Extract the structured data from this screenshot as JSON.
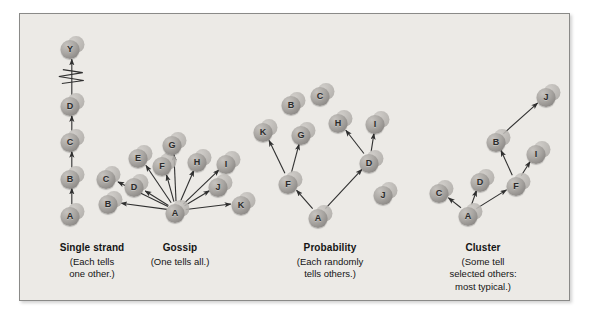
{
  "figure": {
    "background": "#ffffff",
    "panel_background": "#eceae6",
    "border_color": "#8a8a88",
    "node_color": "#a9a6a2",
    "arrow_color": "#2f2f2f",
    "text_color": "#141414"
  },
  "panels": [
    {
      "id": "single-strand",
      "caption_title": "Single strand",
      "caption_lines": [
        "(Each tells",
        "one other.)"
      ],
      "caption_x": 92,
      "caption_y": 242,
      "nodes": [
        {
          "label": "Y",
          "x": 72,
          "y": 48
        },
        {
          "label": "D",
          "x": 72,
          "y": 105
        },
        {
          "label": "C",
          "x": 72,
          "y": 141
        },
        {
          "label": "B",
          "x": 72,
          "y": 178
        },
        {
          "label": "A",
          "x": 72,
          "y": 215
        }
      ],
      "edges": [
        {
          "from": "A",
          "to": "B"
        },
        {
          "from": "B",
          "to": "C"
        },
        {
          "from": "C",
          "to": "D"
        },
        {
          "from": "D",
          "to": "Y"
        }
      ],
      "break_symbol": {
        "x": 72,
        "y": 76,
        "label": "break-zigzag"
      }
    },
    {
      "id": "gossip",
      "caption_title": "Gossip",
      "caption_lines": [
        "(One tells all.)"
      ],
      "caption_x": 180,
      "caption_y": 242,
      "nodes": [
        {
          "label": "A",
          "x": 177,
          "y": 212
        },
        {
          "label": "B",
          "x": 110,
          "y": 203
        },
        {
          "label": "C",
          "x": 108,
          "y": 178
        },
        {
          "label": "D",
          "x": 136,
          "y": 186
        },
        {
          "label": "E",
          "x": 140,
          "y": 157
        },
        {
          "label": "F",
          "x": 164,
          "y": 165
        },
        {
          "label": "G",
          "x": 174,
          "y": 144
        },
        {
          "label": "H",
          "x": 199,
          "y": 161
        },
        {
          "label": "I",
          "x": 228,
          "y": 163
        },
        {
          "label": "J",
          "x": 220,
          "y": 186
        },
        {
          "label": "K",
          "x": 243,
          "y": 204
        }
      ],
      "edges": [
        {
          "from": "A",
          "to": "B"
        },
        {
          "from": "A",
          "to": "C"
        },
        {
          "from": "A",
          "to": "D"
        },
        {
          "from": "A",
          "to": "E"
        },
        {
          "from": "A",
          "to": "F"
        },
        {
          "from": "A",
          "to": "G"
        },
        {
          "from": "A",
          "to": "H"
        },
        {
          "from": "A",
          "to": "I"
        },
        {
          "from": "A",
          "to": "J"
        },
        {
          "from": "A",
          "to": "K"
        }
      ]
    },
    {
      "id": "probability",
      "caption_title": "Probability",
      "caption_lines": [
        "(Each randomly",
        "tells others.)"
      ],
      "caption_x": 330,
      "caption_y": 242,
      "nodes": [
        {
          "label": "A",
          "x": 320,
          "y": 217
        },
        {
          "label": "B",
          "x": 293,
          "y": 104
        },
        {
          "label": "C",
          "x": 322,
          "y": 95
        },
        {
          "label": "D",
          "x": 371,
          "y": 162
        },
        {
          "label": "F",
          "x": 290,
          "y": 183
        },
        {
          "label": "G",
          "x": 303,
          "y": 134
        },
        {
          "label": "H",
          "x": 340,
          "y": 122
        },
        {
          "label": "I",
          "x": 377,
          "y": 123
        },
        {
          "label": "J",
          "x": 385,
          "y": 194
        },
        {
          "label": "K",
          "x": 265,
          "y": 131
        }
      ],
      "edges": [
        {
          "from": "A",
          "to": "F"
        },
        {
          "from": "A",
          "to": "D"
        },
        {
          "from": "F",
          "to": "K"
        },
        {
          "from": "F",
          "to": "G"
        },
        {
          "from": "D",
          "to": "H"
        },
        {
          "from": "D",
          "to": "I"
        }
      ]
    },
    {
      "id": "cluster",
      "caption_title": "Cluster",
      "caption_lines": [
        "(Some tell",
        "selected others:",
        "most typical.)"
      ],
      "caption_x": 483,
      "caption_y": 242,
      "nodes": [
        {
          "label": "A",
          "x": 470,
          "y": 215
        },
        {
          "label": "B",
          "x": 498,
          "y": 141
        },
        {
          "label": "C",
          "x": 441,
          "y": 192
        },
        {
          "label": "D",
          "x": 482,
          "y": 181
        },
        {
          "label": "F",
          "x": 518,
          "y": 185
        },
        {
          "label": "I",
          "x": 538,
          "y": 153
        },
        {
          "label": "J",
          "x": 548,
          "y": 96
        }
      ],
      "edges": [
        {
          "from": "A",
          "to": "C"
        },
        {
          "from": "A",
          "to": "D"
        },
        {
          "from": "A",
          "to": "F"
        },
        {
          "from": "F",
          "to": "B"
        },
        {
          "from": "F",
          "to": "I"
        },
        {
          "from": "B",
          "to": "J"
        }
      ]
    }
  ]
}
